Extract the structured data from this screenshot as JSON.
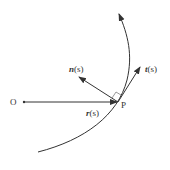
{
  "diagram": {
    "title": "",
    "labels": {
      "origin": "O",
      "point": "P",
      "normal_vec": "n",
      "normal_arg": "(s)",
      "tangent_vec": "t",
      "tangent_arg": "(s)",
      "position_vec": "r",
      "position_arg": "(s)"
    },
    "elements": [
      {
        "id": "curve",
        "type": "curve",
        "description": "curve with arrow pointing upward, concave to the left"
      },
      {
        "id": "position-vector",
        "from": "O",
        "to": "P",
        "label": "r(s)"
      },
      {
        "id": "tangent-vector",
        "from": "P",
        "label": "t(s)",
        "direction": "along curve, up-right"
      },
      {
        "id": "normal-vector",
        "from": "P",
        "label": "n(s)",
        "direction": "up-left, perpendicular to tangent"
      },
      {
        "id": "right-angle-mark",
        "at": "P",
        "between": [
          "n(s)",
          "t(s)"
        ]
      }
    ],
    "colors": {
      "stroke": "#333333",
      "background": "#ffffff"
    }
  }
}
